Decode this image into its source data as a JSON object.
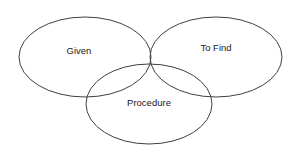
{
  "diagram": {
    "type": "venn-diagram",
    "title": "",
    "background_color": "#ffffff",
    "stroke_color": "#3f3f3f",
    "text_color": "#1a1a1a",
    "sets": [
      {
        "id": "given",
        "label": "Given",
        "label_x": 79,
        "label_y": 51,
        "cx": 85,
        "cy": 57,
        "rx": 66,
        "ry": 40
      },
      {
        "id": "to-find",
        "label": "To Find",
        "label_x": 216,
        "label_y": 48,
        "cx": 216,
        "cy": 57,
        "rx": 66,
        "ry": 40
      },
      {
        "id": "procedure",
        "label": "Procedure",
        "label_x": 149,
        "label_y": 103,
        "cx": 149,
        "cy": 104,
        "rx": 63,
        "ry": 40
      }
    ]
  }
}
